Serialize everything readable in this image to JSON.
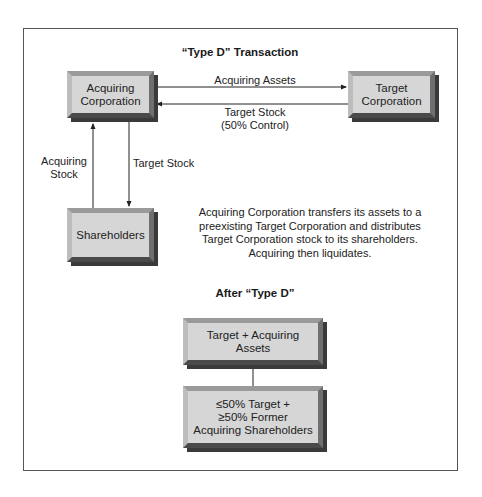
{
  "diagram": {
    "title": "“Type D” Transaction",
    "nodes": {
      "acquiring": "Acquiring Corporation",
      "acquiring_line1": "Acquiring",
      "acquiring_line2": "Corporation",
      "target_line1": "Target",
      "target_line2": "Corporation",
      "shareholders": "Shareholders"
    },
    "edges": {
      "acquiring_assets": "Acquiring Assets",
      "target_stock_control_line1": "Target Stock",
      "target_stock_control_line2": "(50% Control)",
      "acquiring_stock_line1": "Acquiring",
      "acquiring_stock_line2": "Stock",
      "target_stock": "Target Stock"
    },
    "description": {
      "line1": "Acquiring Corporation transfers its assets to a",
      "line2": "preexisting Target Corporation and distributes",
      "line3": "Target Corporation stock to its shareholders.",
      "line4": "Acquiring then liquidates."
    },
    "after": {
      "title": "After “Type D”",
      "box1_line1": "Target + Acquiring",
      "box1_line2": "Assets",
      "box2_line1": "≤50% Target +",
      "box2_line2": "≥50% Former",
      "box2_line3": "Acquiring Shareholders"
    }
  }
}
